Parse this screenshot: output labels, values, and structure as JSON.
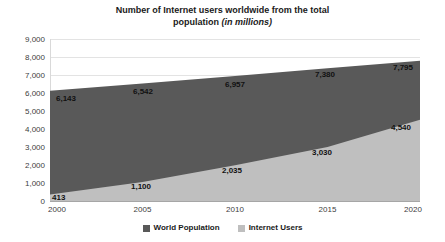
{
  "chart_data": {
    "type": "area",
    "title": "Number of Internet users worldwide from the total population (in millions)",
    "title_main": "Number of Internet users worldwide from the total",
    "title_line2_prefix": "population ",
    "title_line2_italic": "(in millions)",
    "xlabel": "",
    "ylabel": "",
    "x": [
      2000,
      2005,
      2010,
      2015,
      2020
    ],
    "categories": [
      "2000",
      "2005",
      "2010",
      "2015",
      "2020"
    ],
    "series": [
      {
        "name": "World Population",
        "color": "#595959",
        "values": [
          6143,
          6542,
          6957,
          7380,
          7795
        ],
        "labels": [
          "6,143",
          "6,542",
          "6,957",
          "7,380",
          "7,795"
        ]
      },
      {
        "name": "Internet Users",
        "color": "#bfbfbf",
        "values": [
          413,
          1100,
          2035,
          3030,
          4540
        ],
        "labels": [
          "413",
          "1,100",
          "2,035",
          "3,030",
          "4,540"
        ]
      }
    ],
    "ylim": [
      0,
      9000
    ],
    "xlim": [
      2000,
      2020
    ],
    "yticks": [
      0,
      1000,
      2000,
      3000,
      4000,
      5000,
      6000,
      7000,
      8000,
      9000
    ],
    "ytick_labels": [
      "0",
      "1,000",
      "2,000",
      "3,000",
      "4,000",
      "5,000",
      "6,000",
      "7,000",
      "8,000",
      "9,000"
    ],
    "grid": true,
    "legend_position": "bottom",
    "stacked": false
  },
  "legend": {
    "items": [
      {
        "label": "World Population",
        "color": "#595959"
      },
      {
        "label": "Internet Users",
        "color": "#bfbfbf"
      }
    ]
  }
}
